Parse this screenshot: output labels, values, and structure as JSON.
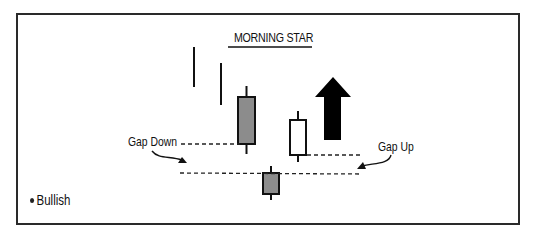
{
  "diagram": {
    "title": "MORNING STAR",
    "labels": {
      "gap_down": "Gap Down",
      "gap_up": "Gap Up"
    },
    "legend": {
      "items": [
        {
          "bullet": "•",
          "label": "Bullish"
        }
      ]
    },
    "candles": [
      {
        "name": "prior-wick-1",
        "type": "line"
      },
      {
        "name": "prior-wick-2",
        "type": "line"
      },
      {
        "name": "bearish-candle",
        "color": "#8c8c8c"
      },
      {
        "name": "star-candle",
        "color": "#8c8c8c"
      },
      {
        "name": "bullish-candle",
        "color": "#ffffff"
      }
    ],
    "arrow": {
      "direction": "up",
      "color": "#000000"
    },
    "colors": {
      "stroke": "#111111",
      "bearish_fill": "#8c8c8c",
      "bullish_fill": "#ffffff"
    }
  }
}
